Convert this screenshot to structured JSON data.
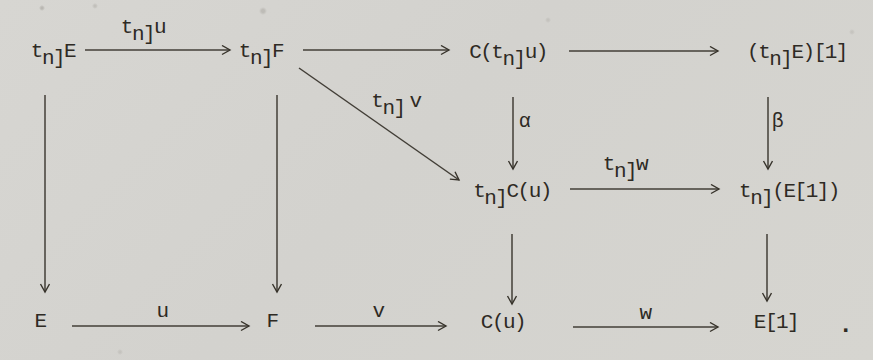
{
  "page": {
    "kind": "scanned typewritten commutative diagram",
    "background_color": "#d5d4d0",
    "ink_color": "#332f28"
  },
  "diagram": {
    "nodes": {
      "tn_E": {
        "pre": "t",
        "sub": "n]",
        "post": "E"
      },
      "tn_F": {
        "pre": "t",
        "sub": "n]",
        "post": "F"
      },
      "C_tn_u": {
        "pre": "C(t",
        "sub": "n]",
        "post": "u)"
      },
      "tn_E_shift": {
        "pre": "(t",
        "sub": "n]",
        "post": "E)[1]"
      },
      "tn_Cu": {
        "pre": "t",
        "sub": "n]",
        "post": "C(u)"
      },
      "tn_E1": {
        "pre": "t",
        "sub": "n]",
        "post": "(E[1])"
      },
      "E": {
        "text": "E"
      },
      "F": {
        "text": "F"
      },
      "Cu": {
        "text": "C(u)"
      },
      "E1": {
        "text": "E[1]"
      },
      "period": {
        "text": "."
      }
    },
    "labels": {
      "tn_u": {
        "pre": "t",
        "sub": "n]",
        "post": "u"
      },
      "tn_v": {
        "pre": "t",
        "sub": "n]",
        "post": "v"
      },
      "tn_w": {
        "pre": "t",
        "sub": "n]",
        "post": "w"
      },
      "alpha": {
        "text": "α"
      },
      "beta": {
        "text": "β"
      },
      "u": {
        "text": "u"
      },
      "v": {
        "text": "v"
      },
      "w": {
        "text": "w"
      }
    },
    "edges": [
      {
        "from": "tn_E",
        "to": "tn_F",
        "label": "tn_u",
        "direction": "right"
      },
      {
        "from": "tn_F",
        "to": "C_tn_u",
        "label": "",
        "direction": "right"
      },
      {
        "from": "C_tn_u",
        "to": "tn_E_shift",
        "label": "",
        "direction": "right"
      },
      {
        "from": "tn_F",
        "to": "tn_Cu",
        "label": "tn_v",
        "direction": "diagonal-down-right"
      },
      {
        "from": "C_tn_u",
        "to": "tn_Cu",
        "label": "alpha",
        "direction": "down"
      },
      {
        "from": "tn_E_shift",
        "to": "tn_E1",
        "label": "beta",
        "direction": "down"
      },
      {
        "from": "tn_Cu",
        "to": "tn_E1",
        "label": "tn_w",
        "direction": "right"
      },
      {
        "from": "tn_E",
        "to": "E",
        "label": "",
        "direction": "down"
      },
      {
        "from": "tn_F",
        "to": "F",
        "label": "",
        "direction": "down"
      },
      {
        "from": "tn_Cu",
        "to": "Cu",
        "label": "",
        "direction": "down"
      },
      {
        "from": "tn_E1",
        "to": "E1",
        "label": "",
        "direction": "down"
      },
      {
        "from": "E",
        "to": "F",
        "label": "u",
        "direction": "right"
      },
      {
        "from": "F",
        "to": "Cu",
        "label": "v",
        "direction": "right"
      },
      {
        "from": "Cu",
        "to": "E1",
        "label": "w",
        "direction": "right"
      }
    ]
  }
}
